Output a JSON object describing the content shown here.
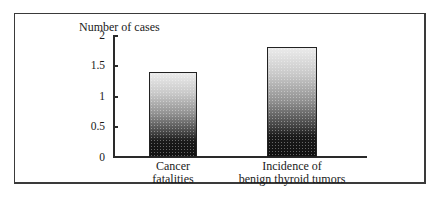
{
  "chart_data": {
    "type": "bar",
    "title": "",
    "xlabel": "",
    "ylabel": "Number of cases",
    "ylim": [
      0,
      2
    ],
    "yticks": [
      "0",
      "0.5",
      "1",
      "1.5",
      "2"
    ],
    "grid": false,
    "legend": null,
    "categories": [
      "Cancer fatalities",
      "Incidence of benign thyroid tumors"
    ],
    "category_lines": [
      [
        "Cancer",
        "fatalities"
      ],
      [
        "Incidence of",
        "benign thyroid tumors"
      ]
    ],
    "values": [
      1.4,
      1.8
    ],
    "bar_fill": "vertical gradient, light stipple at top to black at bottom"
  }
}
